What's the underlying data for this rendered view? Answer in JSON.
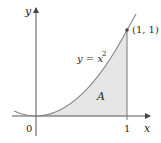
{
  "figure": {
    "axes": {
      "x_label": "x",
      "y_label": "y",
      "origin_label": "0",
      "x_tick_label": "1"
    },
    "curve": {
      "equation_lhs": "y = x",
      "equation_exp": "2"
    },
    "point_label": "(1, 1)",
    "region_label": "A",
    "colors": {
      "curve": "#8a8a8a",
      "axis": "#555555",
      "region_fill": "#e6e6e6"
    }
  }
}
